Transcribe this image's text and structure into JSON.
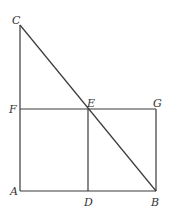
{
  "diagram": {
    "points": {
      "A": {
        "label": "A",
        "x": 20,
        "y": 191
      },
      "B": {
        "label": "B",
        "x": 156,
        "y": 191
      },
      "C": {
        "label": "C",
        "x": 20,
        "y": 25
      },
      "D": {
        "label": "D",
        "x": 88,
        "y": 191
      },
      "E": {
        "label": "E",
        "x": 88,
        "y": 109
      },
      "F": {
        "label": "F",
        "x": 20,
        "y": 109
      },
      "G": {
        "label": "G",
        "x": 156,
        "y": 109
      }
    },
    "segments": [
      "CA",
      "AB",
      "CB",
      "FG",
      "ED",
      "GB"
    ],
    "stroke_color": "#3a3a3a",
    "label_color": "#333333"
  }
}
